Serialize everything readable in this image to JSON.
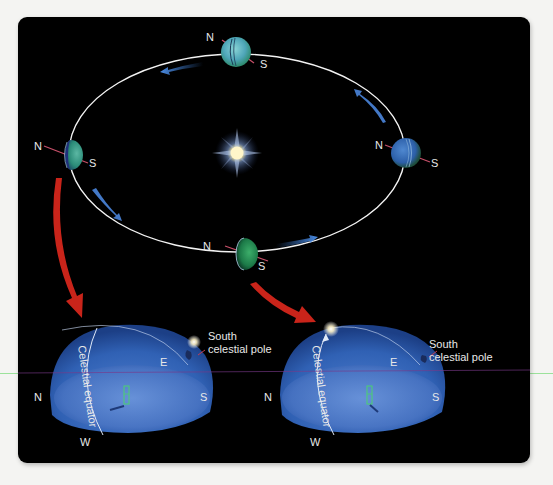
{
  "figure": {
    "background_color": "#000000",
    "page_color": "#f4f4f2",
    "orbit_color": "#f2f2f2",
    "motion_arrow_color": "#3e7fd6",
    "pointer_arrow_color": "#d0261c",
    "dome_color": "#2f63b8"
  },
  "orbit": {
    "sun": {
      "label": ""
    },
    "planets": [
      {
        "position": "top",
        "north_label": "N",
        "south_label": "S"
      },
      {
        "position": "left",
        "north_label": "N",
        "south_label": "S"
      },
      {
        "position": "right",
        "north_label": "N",
        "south_label": "S"
      },
      {
        "position": "bottom",
        "north_label": "N",
        "south_label": "S"
      }
    ]
  },
  "domes": [
    {
      "id": "left",
      "equator_label": "Celestial equator",
      "pole_label_line1": "South",
      "pole_label_line2": "celestial pole",
      "north": "N",
      "south": "S",
      "east": "E",
      "west": "W"
    },
    {
      "id": "right",
      "equator_label": "Celestial equator",
      "pole_label_line1": "South",
      "pole_label_line2": "celestial pole",
      "north": "N",
      "south": "S",
      "east": "E",
      "west": "W"
    }
  ]
}
